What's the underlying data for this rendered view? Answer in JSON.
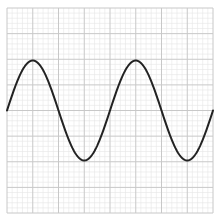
{
  "chart_data": {
    "type": "line",
    "title": "",
    "xlabel": "",
    "ylabel": "",
    "grid": true,
    "grid_major_divisions": 8,
    "grid_minor_per_major": 5,
    "legend": null,
    "xlim": [
      0,
      8
    ],
    "ylim": [
      -4,
      4
    ],
    "series": [
      {
        "name": "sine",
        "amplitude": 1.95,
        "period": 4.0,
        "phase": 0,
        "x": [
          0,
          0.5,
          1,
          1.5,
          2,
          2.5,
          3,
          3.5,
          4,
          4.5,
          5,
          5.5,
          6,
          6.5,
          7,
          7.5,
          8
        ],
        "values": [
          0,
          1.38,
          1.95,
          1.38,
          0,
          -1.38,
          -1.95,
          -1.38,
          0,
          1.38,
          1.95,
          1.38,
          0,
          -1.38,
          -1.95,
          -1.38,
          0
        ]
      }
    ],
    "colors": {
      "line": "#222222",
      "major_grid": "#c8c8c8",
      "minor_grid": "#e6e6e6",
      "background": "#ffffff"
    }
  }
}
